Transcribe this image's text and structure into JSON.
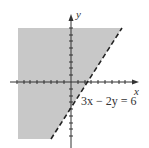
{
  "figure": {
    "x_label": "x",
    "y_label": "y",
    "equation": "3x − 2y = 6",
    "boundary": "dashed",
    "shaded_side": "left/above line (3x - 2y < 6)",
    "colors": {
      "shade": "#c8c8c8",
      "axis": "#333333",
      "line": "#222222"
    }
  }
}
